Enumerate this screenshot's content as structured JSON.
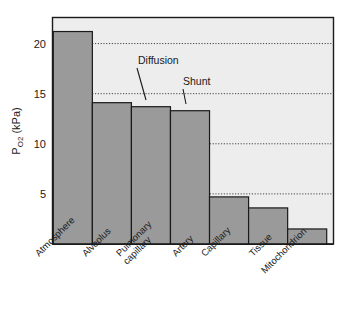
{
  "chart_data": {
    "type": "bar",
    "title": "",
    "xlabel": "",
    "ylabel": "Po2 (kPa)",
    "ylabel_main": "P",
    "ylabel_sub": "O",
    "ylabel_sub2": "2",
    "ylabel_unit": " (kPa)",
    "categories": [
      "Atmosphere",
      "Pulmonary capillary",
      "Alveolus",
      "Artery",
      "Capillary",
      "Tissue",
      "Mitochondrion"
    ],
    "bars": [
      {
        "label": "Atmosphere",
        "label_line1": "Atmosphere",
        "label_line2": "",
        "value": 21.2
      },
      {
        "label": "Alveolus",
        "label_line1": "Alveolus",
        "label_line2": "",
        "value": 14.1
      },
      {
        "label": "Pulmonary capillary",
        "label_line1": "Pulmonary",
        "label_line2": "capillary",
        "value": 13.7
      },
      {
        "label": "Artery",
        "label_line1": "Artery",
        "label_line2": "",
        "value": 13.3
      },
      {
        "label": "Capillary",
        "label_line1": "Capillary",
        "label_line2": "",
        "value": 4.7
      },
      {
        "label": "Tissue",
        "label_line1": "Tissue",
        "label_line2": "",
        "value": 3.6
      },
      {
        "label": "Mitochondrion",
        "label_line1": "Mitochondrion",
        "label_line2": "",
        "value": 1.5
      }
    ],
    "values": [
      21.2,
      14.1,
      13.7,
      13.3,
      4.7,
      3.6,
      1.5
    ],
    "yticks": [
      5,
      10,
      15,
      20
    ],
    "ytick_labels": [
      "5",
      "10",
      "15",
      "20"
    ],
    "ylim": [
      0,
      22.6
    ],
    "grid": true,
    "grid_axis": "y",
    "legend": "none",
    "annotations": [
      {
        "text": "Diffusion",
        "points_to_bar": "Pulmonary capillary",
        "value_at_arrow": 13.7
      },
      {
        "text": "Shunt",
        "points_to_bar": "Artery",
        "value_at_arrow": 13.3
      }
    ],
    "colors": {
      "bar_fill": "#9a9a9a",
      "bar_edge": "#1a1a1a",
      "plot_background": "#ededed",
      "figure_background": "#ffffff",
      "gridline": "#333333",
      "text": "#1a1a1a"
    }
  }
}
